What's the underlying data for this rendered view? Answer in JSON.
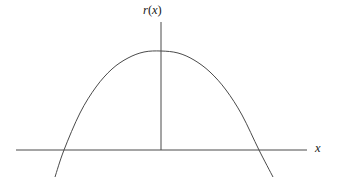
{
  "figure": {
    "title": "",
    "background_color": "#ffffff",
    "line_color": "#4a4a4a",
    "label_color": "#1a1a1a",
    "labels": {
      "function_label": {
        "name": "r",
        "open_paren": "(",
        "variable": "x",
        "close_paren": ")",
        "full_text": "r(x)"
      },
      "x_axis_label": {
        "variable": "x",
        "full_text": "x"
      }
    }
  },
  "chart_data": {
    "type": "line",
    "title": "r(x)",
    "xlabel": "x",
    "ylabel": "r(x)",
    "grid": false,
    "legend_position": "none",
    "axis_ranges": {
      "x_axis_pixel_span": [
        16,
        307
      ],
      "x_axis_pixel_y": 150,
      "y_axis_pixel_x": 161,
      "y_axis_pixel_span": [
        22,
        150
      ]
    },
    "annotations": [
      "downward-opening parabola",
      "vertical segment from vertex to x-axis",
      "curve crosses x-axis at two roots"
    ],
    "features": {
      "vertex": {
        "x_px": 161,
        "y_px": 51
      },
      "left_root": {
        "x_px": 64,
        "y_px": 150
      },
      "right_root": {
        "x_px": 259,
        "y_px": 150
      },
      "left_branch_end": {
        "x_px": 55,
        "y_px": 177
      },
      "right_branch_end": {
        "x_px": 273,
        "y_px": 177
      }
    },
    "series": [
      {
        "name": "r(x)",
        "points_px": [
          [
            55,
            177
          ],
          [
            64,
            150
          ],
          [
            80,
            113
          ],
          [
            96,
            87
          ],
          [
            112,
            69
          ],
          [
            128,
            58
          ],
          [
            144,
            52
          ],
          [
            161,
            51
          ],
          [
            178,
            53
          ],
          [
            194,
            60
          ],
          [
            210,
            72
          ],
          [
            226,
            90
          ],
          [
            242,
            115
          ],
          [
            259,
            150
          ],
          [
            273,
            177
          ]
        ]
      }
    ]
  }
}
